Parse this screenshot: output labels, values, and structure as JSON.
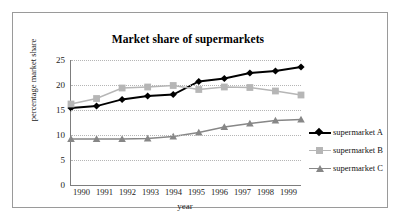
{
  "chart_data": {
    "type": "line",
    "title": "Market share of supermarkets",
    "xlabel": "year",
    "ylabel": "percentage market share",
    "categories": [
      "1990",
      "1991",
      "1992",
      "1993",
      "1994",
      "1995",
      "1996",
      "1997",
      "1998",
      "1999"
    ],
    "yticks": [
      "0",
      "5",
      "10",
      "15",
      "20",
      "25"
    ],
    "ylim": [
      0,
      25
    ],
    "grid": true,
    "legend_position": "right",
    "series": [
      {
        "name": "supermarket A",
        "color": "#000000",
        "marker": "diamond",
        "values": [
          15.4,
          15.8,
          17.1,
          17.8,
          18.1,
          20.7,
          21.3,
          22.4,
          22.8,
          23.6
        ]
      },
      {
        "name": "supermarket B",
        "color": "#b6b6b6",
        "marker": "square",
        "values": [
          16.2,
          17.3,
          19.4,
          19.6,
          19.9,
          19.1,
          19.6,
          19.5,
          18.8,
          18.0
        ]
      },
      {
        "name": "supermarket C",
        "color": "#878787",
        "marker": "triangle",
        "values": [
          9.2,
          9.2,
          9.2,
          9.3,
          9.7,
          10.5,
          11.6,
          12.3,
          12.9,
          13.1
        ]
      }
    ]
  }
}
